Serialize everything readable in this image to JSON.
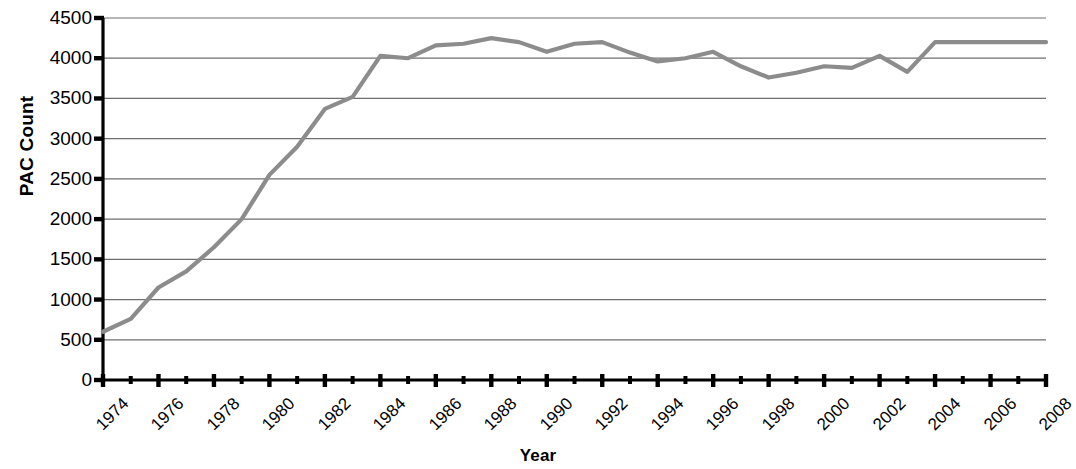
{
  "chart_data": {
    "type": "line",
    "title": "",
    "xlabel": "Year",
    "ylabel": "PAC Count",
    "xlim": [
      1974,
      2008
    ],
    "ylim": [
      0,
      4500
    ],
    "grid": true,
    "legend": false,
    "line_color": "#8c8c8c",
    "axis_color": "#000000",
    "gridline_color": "#6e6e6e",
    "background_color": "#ffffff",
    "y_ticks": [
      0,
      500,
      1000,
      1500,
      2000,
      2500,
      3000,
      3500,
      4000,
      4500
    ],
    "y_tick_labels": [
      "0",
      "500",
      "1000",
      "1500",
      "2000",
      "2500",
      "3000",
      "3500",
      "4000",
      "4500"
    ],
    "x_ticks": [
      1974,
      1976,
      1978,
      1980,
      1982,
      1984,
      1986,
      1988,
      1990,
      1992,
      1994,
      1996,
      1998,
      2000,
      2002,
      2004,
      2006,
      2008
    ],
    "x_tick_labels": [
      "1974",
      "1976",
      "1978",
      "1980",
      "1982",
      "1984",
      "1986",
      "1988",
      "1990",
      "1992",
      "1994",
      "1996",
      "1998",
      "2000",
      "2002",
      "2004",
      "2006",
      "2008"
    ],
    "x_minor_ticks": [
      1975,
      1977,
      1979,
      1981,
      1983,
      1985,
      1987,
      1989,
      1991,
      1993,
      1995,
      1997,
      1999,
      2001,
      2003,
      2005,
      2007
    ],
    "x": [
      1974,
      1975,
      1976,
      1977,
      1978,
      1979,
      1980,
      1981,
      1982,
      1983,
      1984,
      1985,
      1986,
      1987,
      1988,
      1989,
      1990,
      1991,
      1992,
      1993,
      1994,
      1995,
      1996,
      1997,
      1998,
      1999,
      2000,
      2001,
      2002,
      2003,
      2004,
      2005,
      2006,
      2007,
      2008
    ],
    "y": [
      600,
      760,
      1150,
      1350,
      1650,
      2000,
      2550,
      2900,
      3370,
      3520,
      4030,
      4000,
      4160,
      4180,
      4250,
      4200,
      4080,
      4180,
      4200,
      4070,
      3960,
      4000,
      4080,
      3900,
      3760,
      3820,
      3900,
      3880,
      4030,
      3830,
      4200,
      4200,
      4200,
      4200,
      4200
    ],
    "series": [
      {
        "name": "PAC Count",
        "values": [
          600,
          760,
          1150,
          1350,
          1650,
          2000,
          2550,
          2900,
          3370,
          3520,
          4030,
          4000,
          4160,
          4180,
          4250,
          4200,
          4080,
          4180,
          4200,
          4070,
          3960,
          4000,
          4080,
          3900,
          3760,
          3820,
          3900,
          3880,
          4030,
          3830,
          4200,
          4200,
          4200,
          4200,
          4200
        ]
      }
    ]
  }
}
